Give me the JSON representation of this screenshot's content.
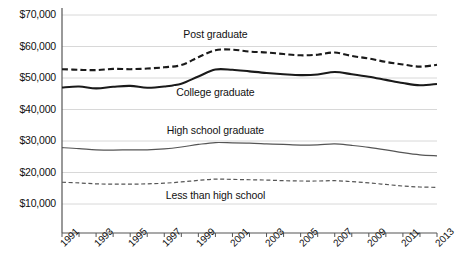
{
  "chart_data": {
    "type": "line",
    "title": "",
    "xlabel": "",
    "ylabel": "",
    "ylim": [
      5000,
      72000
    ],
    "xlim": [
      1991,
      2013
    ],
    "grid": true,
    "legend_position": "inline-labels",
    "ytick_labels": [
      "$70,000",
      "$60,000",
      "$50,000",
      "$40,000",
      "$30,000",
      "$20,000",
      "$10,000"
    ],
    "ytick_values": [
      70000,
      60000,
      50000,
      40000,
      30000,
      20000,
      10000
    ],
    "x": [
      1991,
      1992,
      1993,
      1994,
      1995,
      1996,
      1997,
      1998,
      1999,
      2000,
      2001,
      2002,
      2003,
      2004,
      2005,
      2006,
      2007,
      2008,
      2009,
      2010,
      2011,
      2012,
      2013
    ],
    "xtick_labels": [
      "1991",
      "1993",
      "1995",
      "1997",
      "1999",
      "2001",
      "2003",
      "2005",
      "2007",
      "2009",
      "2011",
      "2013"
    ],
    "xtick_label_values": [
      1991,
      1993,
      1995,
      1997,
      1999,
      2001,
      2003,
      2005,
      2007,
      2009,
      2011,
      2013
    ],
    "series": [
      {
        "name": "Post graduate",
        "style": "dashed",
        "width": "thick",
        "color": "#1a1a1a",
        "label_x": 2000,
        "label_y": 63500,
        "values": [
          52800,
          52600,
          52500,
          52900,
          52800,
          53000,
          53400,
          54100,
          56600,
          58800,
          59000,
          58400,
          58100,
          57600,
          57200,
          57400,
          58100,
          57000,
          56200,
          55100,
          54300,
          53600,
          54200
        ]
      },
      {
        "name": "College graduate",
        "style": "solid",
        "width": "thick",
        "color": "#1a1a1a",
        "label_x": 2000,
        "label_y": 45200,
        "values": [
          47000,
          47300,
          46700,
          47200,
          47500,
          46900,
          47300,
          48200,
          50500,
          52700,
          52600,
          52100,
          51600,
          51200,
          50900,
          51100,
          51900,
          51200,
          50400,
          49400,
          48400,
          47700,
          48100
        ]
      },
      {
        "name": "High school graduate",
        "style": "solid",
        "width": "thin",
        "color": "#555555",
        "label_x": 2000,
        "label_y": 33200,
        "values": [
          27900,
          27600,
          27200,
          27100,
          27200,
          27200,
          27500,
          28100,
          28900,
          29500,
          29400,
          29300,
          29100,
          28900,
          28700,
          28800,
          29100,
          28600,
          28000,
          27200,
          26300,
          25600,
          25300
        ]
      },
      {
        "name": "Less than high school",
        "style": "dashed",
        "width": "thin",
        "color": "#555555",
        "label_x": 2000,
        "label_y": 12600,
        "values": [
          16900,
          16700,
          16400,
          16300,
          16300,
          16400,
          16600,
          17000,
          17500,
          17900,
          17800,
          17700,
          17600,
          17400,
          17300,
          17300,
          17400,
          17100,
          16700,
          16200,
          15700,
          15400,
          15300
        ]
      }
    ]
  }
}
